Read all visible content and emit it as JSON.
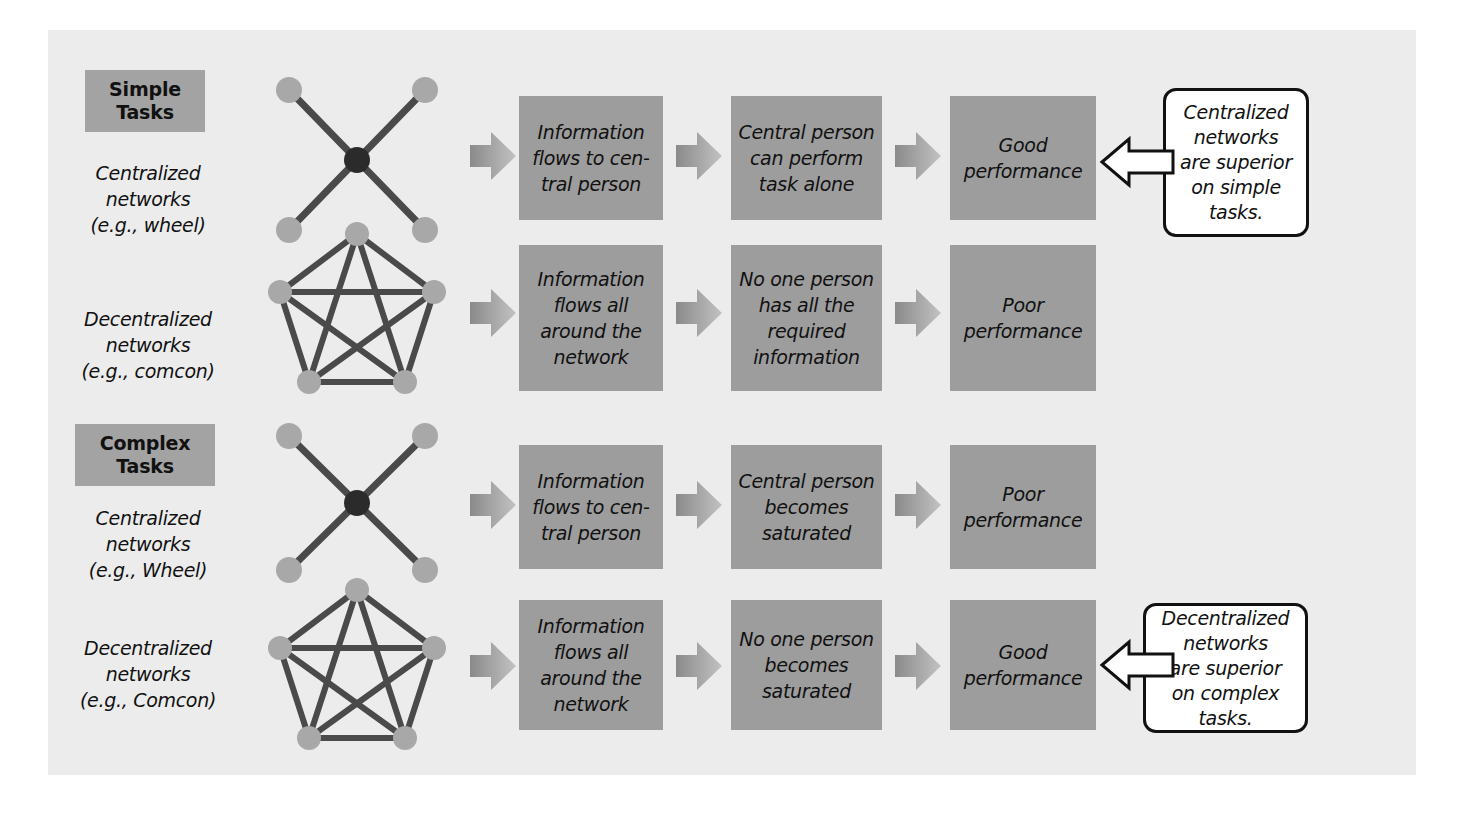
{
  "colors": {
    "page_background": "#ffffff",
    "panel_background": "#ececec",
    "process_box_fill": "#9d9d9d",
    "badge_fill": "#a3a3a3",
    "node_fill": "#a8a8a8",
    "center_node_fill": "#2b2b2b",
    "edge_stroke": "#4a4a4a",
    "chevron_light": "#b4b4b4",
    "chevron_dark": "#8a8a8a",
    "callout_border": "#111111",
    "callout_fill": "#ffffff",
    "text": "#111111"
  },
  "rows": [
    {
      "id": "simple-centralized",
      "badge": "Simple\nTasks",
      "badge_line1": "Simple",
      "badge_line2": "Tasks",
      "network_label_line1": "Centralized",
      "network_label_line2": "networks",
      "network_label_line3": "(e.g., wheel)",
      "network_type": "wheel",
      "steps": [
        "Information flows to cen-tral person",
        "Central person can perform task alone",
        "Good performance"
      ],
      "step_lines": [
        [
          "Information",
          "flows to cen-",
          "tral person"
        ],
        [
          "Central person",
          "can perform",
          "task alone"
        ],
        [
          "Good",
          "performance"
        ]
      ]
    },
    {
      "id": "simple-decentralized",
      "badge": "",
      "network_label_line1": "Decentralized",
      "network_label_line2": "networks",
      "network_label_line3": "(e.g., comcon)",
      "network_type": "comcon",
      "steps": [
        "Information flows all around the network",
        "No one person has all the required information",
        "Poor performance"
      ],
      "step_lines": [
        [
          "Information",
          "flows all",
          "around the",
          "network"
        ],
        [
          "No one person",
          "has all the",
          "required",
          "information"
        ],
        [
          "Poor",
          "performance"
        ]
      ]
    },
    {
      "id": "complex-centralized",
      "badge_line1": "Complex",
      "badge_line2": "Tasks",
      "network_label_line1": "Centralized",
      "network_label_line2": "networks",
      "network_label_line3": "(e.g., Wheel)",
      "network_type": "wheel",
      "steps": [
        "Information flows to cen-tral person",
        "Central person becomes saturated",
        "Poor performance"
      ],
      "step_lines": [
        [
          "Information",
          "flows to cen-",
          "tral person"
        ],
        [
          "Central person",
          "becomes",
          "saturated"
        ],
        [
          "Poor",
          "performance"
        ]
      ]
    },
    {
      "id": "complex-decentralized",
      "badge": "",
      "network_label_line1": "Decentralized",
      "network_label_line2": "networks",
      "network_label_line3": "(e.g., Comcon)",
      "network_type": "comcon",
      "steps": [
        "Information flows all around the network",
        "No one person becomes saturated",
        "Good performance"
      ],
      "step_lines": [
        [
          "Information",
          "flows all",
          "around the",
          "network"
        ],
        [
          "No one person",
          "becomes",
          "saturated"
        ],
        [
          "Good",
          "performance"
        ]
      ]
    }
  ],
  "callouts": [
    {
      "id": "callout-simple",
      "text": "Centralized networks are superior on simple tasks.",
      "lines": [
        "Centralized",
        "networks",
        "are superior",
        "on simple",
        "tasks."
      ]
    },
    {
      "id": "callout-complex",
      "text": "Decentralized networks are superior on complex tasks.",
      "lines": [
        "Decentralized",
        "networks",
        "are superior",
        "on complex",
        "tasks."
      ]
    }
  ],
  "icons": {
    "chevron": "chevron-right-arrow-icon",
    "callout_pointer": "arrow-left-icon",
    "wheel_network": "wheel-network-icon",
    "comcon_network": "comcon-network-icon"
  }
}
